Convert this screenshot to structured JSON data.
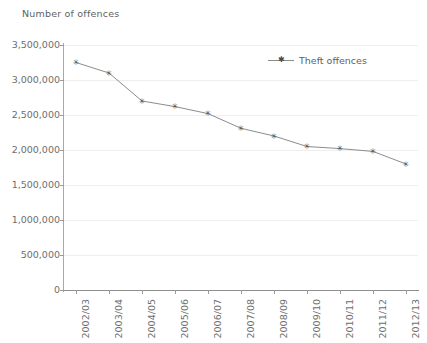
{
  "chart_data": {
    "type": "line",
    "title": "",
    "ylabel": "Number of offences",
    "xlabel": "",
    "categories": [
      "2002/03",
      "2003/04",
      "2004/05",
      "2005/06",
      "2006/07",
      "2007/08",
      "2008/09",
      "2009/10",
      "2010/11",
      "2011/12",
      "2012/13"
    ],
    "series": [
      {
        "name": "Theft offences",
        "values": [
          3250000,
          3100000,
          2700000,
          2620000,
          2520000,
          2310000,
          2200000,
          2050000,
          2020000,
          1980000,
          1800000
        ]
      }
    ],
    "ylim": [
      0,
      3500000
    ],
    "ytick_values": [
      0,
      500000,
      1000000,
      1500000,
      2000000,
      2500000,
      3000000,
      3500000
    ],
    "ytick_labels": [
      "0",
      "500,000",
      "1,000,000",
      "1,500,000",
      "2,000,000",
      "2,500,000",
      "3,000,000",
      "3,500,000"
    ],
    "grid": true,
    "legend_position": "top-center",
    "marker": "star",
    "line_color": "#8c8c8c",
    "marker_color": "#4a4a4a",
    "grid_color": "#eeeef1",
    "axis_color": "#9a9a9a",
    "text_color": "#6e6e6e"
  },
  "legend": {
    "entries": [
      {
        "label": "Theft offences",
        "marker": "star-marker"
      }
    ]
  }
}
